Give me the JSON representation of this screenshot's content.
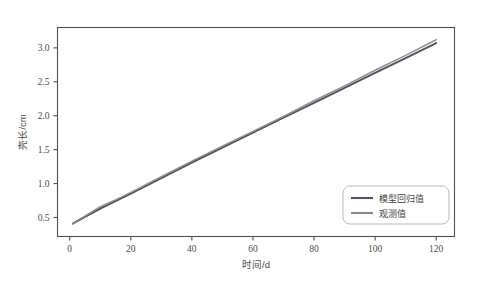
{
  "chart_data": {
    "type": "line",
    "title": "",
    "subtitle": "",
    "xlabel": "时间/d",
    "ylabel": "壳长/cm",
    "xlim": [
      -4,
      126
    ],
    "ylim": [
      0.22,
      3.3
    ],
    "grid": false,
    "legend_position": "lower right",
    "xticks": [
      0,
      20,
      40,
      60,
      80,
      100,
      120
    ],
    "xtick_labels": [
      "0",
      "20",
      "40",
      "60",
      "80",
      "100",
      "120"
    ],
    "yticks": [
      0.5,
      1.0,
      1.5,
      2.0,
      2.5,
      3.0
    ],
    "ytick_labels": [
      "0.5",
      "1.0",
      "1.5",
      "2.0",
      "2.5",
      "3.0"
    ],
    "x": [
      1,
      5,
      10,
      15,
      20,
      30,
      40,
      50,
      60,
      70,
      80,
      90,
      100,
      110,
      120
    ],
    "series": [
      {
        "name": "模型回归值",
        "color": "#4b5563",
        "values": [
          0.41,
          0.51,
          0.63,
          0.74,
          0.85,
          1.08,
          1.31,
          1.53,
          1.75,
          1.97,
          2.19,
          2.41,
          2.63,
          2.85,
          3.07
        ]
      },
      {
        "name": "观测值",
        "color": "#8a8a8a",
        "values": [
          0.41,
          0.52,
          0.66,
          0.76,
          0.87,
          1.1,
          1.33,
          1.55,
          1.77,
          1.99,
          2.22,
          2.44,
          2.67,
          2.89,
          3.12
        ]
      }
    ],
    "annotations": []
  },
  "legend": {
    "entries": [
      {
        "label": "模型回归值",
        "color": "#4b5563"
      },
      {
        "label": "观测值",
        "color": "#8a8a8a"
      }
    ]
  },
  "axes": {
    "x_title": "时间/d",
    "y_title": "壳长/cm",
    "frame_color": "#4f4f4f"
  },
  "figure": {
    "background": "#ffffff"
  }
}
